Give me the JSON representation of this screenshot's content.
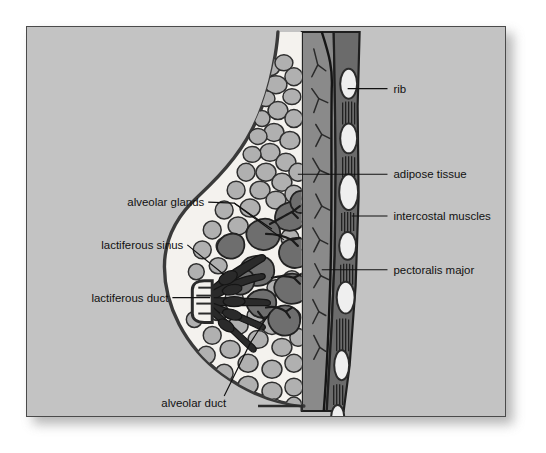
{
  "figure": {
    "title": "Anatomy of the lactating breast (sagittal section)",
    "background_color": "#c3c3c3",
    "frame_border_color": "#4a4a4a",
    "label_color": "#111111"
  },
  "palette": {
    "skin_outline": "#3a3a3a",
    "subcutaneous_white": "#f4f2ee",
    "adipose_tissue": "#b0b0b0",
    "adipose_outline": "#2f2f2f",
    "alveolar_gland": "#6e6e6e",
    "gland_outline": "#222222",
    "duct_dark": "#2a2a2a",
    "pectoralis_major": "#8a8a8a",
    "intercostal_muscle": "#6b6b6b",
    "rib_fill": "#efefef",
    "rib_outline": "#2b2b2b",
    "chest_wall_line": "#1f1f1f"
  },
  "labels": {
    "right": [
      {
        "id": "rib",
        "text": "rib",
        "text_x": 368,
        "text_y": 62,
        "leader": "M 322 62 L 362 62"
      },
      {
        "id": "adipose-tissue",
        "text": "adipose tissue",
        "text_x": 368,
        "text_y": 148,
        "leader": "M 272 148 L 362 148"
      },
      {
        "id": "intercostal-muscles",
        "text": "intercostal muscles",
        "text_x": 368,
        "text_y": 190,
        "leader": "M 326 190 L 362 190"
      },
      {
        "id": "pectoralis-major",
        "text": "pectoralis major",
        "text_x": 368,
        "text_y": 244,
        "leader": "M 305 244 L 362 244"
      }
    ],
    "left": [
      {
        "id": "alveolar-glands",
        "text": "alveolar glands",
        "text_x": 176,
        "text_y": 180
      },
      {
        "id": "lactiferous-sinus",
        "text": "lactiferous sinus",
        "text_x": 155,
        "text_y": 215
      },
      {
        "id": "lactiferous-duct",
        "text": "lactiferous duct",
        "text_x": 140,
        "text_y": 272
      },
      {
        "id": "alveolar-duct",
        "text": "alveolar duct",
        "text_x": 142,
        "text_y": 378
      }
    ]
  },
  "leaders_left": [
    {
      "id": "alveolar-glands-leader-a",
      "path": "M 180 176 L 206 178 L 256 213"
    },
    {
      "id": "alveolar-glands-leader-b",
      "path": "M 206 178 L 239 198 L 244 201"
    },
    {
      "id": "lactiferous-sinus-leader",
      "path": "M 159 219 L 196 248"
    },
    {
      "id": "lactiferous-duct-leader",
      "path": "M 144 272 L 182 272"
    },
    {
      "id": "alveolar-duct-leader",
      "path": "M 196 372 L 222 318 L 243 286"
    }
  ],
  "anatomy": {
    "ribs": [
      {
        "cx": 323,
        "cy": 57,
        "rx": 8.5,
        "ry": 15
      },
      {
        "cx": 323,
        "cy": 112,
        "rx": 8.5,
        "ry": 15
      },
      {
        "cx": 323,
        "cy": 166,
        "rx": 9.5,
        "ry": 18
      },
      {
        "cx": 322,
        "cy": 220,
        "rx": 8.5,
        "ry": 14
      },
      {
        "cx": 320,
        "cy": 272,
        "rx": 9,
        "ry": 16
      },
      {
        "cx": 316,
        "cy": 340,
        "rx": 7.5,
        "ry": 15
      },
      {
        "cx": 312,
        "cy": 392,
        "rx": 6.5,
        "ry": 12
      }
    ],
    "intercostal_bands": [
      {
        "x": 316,
        "y": 76,
        "w": 16,
        "h": 22
      },
      {
        "x": 316,
        "y": 131,
        "w": 16,
        "h": 20
      },
      {
        "x": 315,
        "y": 187,
        "w": 16,
        "h": 18
      },
      {
        "x": 314,
        "y": 239,
        "w": 16,
        "h": 20
      },
      {
        "x": 310,
        "y": 293,
        "w": 15,
        "h": 34
      },
      {
        "x": 307,
        "y": 360,
        "w": 14,
        "h": 20
      }
    ]
  }
}
